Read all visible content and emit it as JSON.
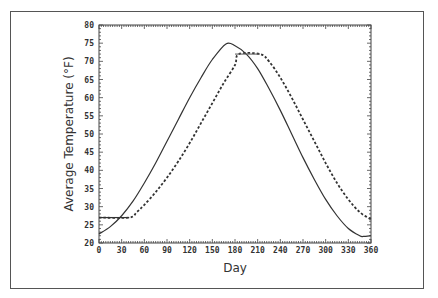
{
  "chart_data": {
    "type": "line",
    "title": "",
    "xlabel": "Day",
    "ylabel": "Average Temperature (°F)",
    "xlim": [
      0,
      360
    ],
    "ylim": [
      20,
      80
    ],
    "xticks": [
      0,
      30,
      60,
      90,
      120,
      150,
      180,
      210,
      240,
      270,
      300,
      330,
      360
    ],
    "yticks": [
      20,
      25,
      30,
      35,
      40,
      45,
      50,
      55,
      60,
      65,
      70,
      75,
      80
    ],
    "grid": false,
    "legend": null,
    "series": [
      {
        "name": "air temperature (solid)",
        "style": "solid",
        "x": [
          0,
          15,
          30,
          45,
          60,
          75,
          90,
          105,
          120,
          135,
          150,
          168,
          180,
          195,
          210,
          225,
          240,
          255,
          270,
          285,
          300,
          315,
          330,
          345,
          350,
          360
        ],
        "y": [
          22.5,
          24.5,
          27.5,
          31.5,
          36.5,
          42,
          48,
          54,
          60,
          65.5,
          70.5,
          74.8,
          74.3,
          72,
          68,
          62.5,
          56.5,
          50,
          43.5,
          37.5,
          32,
          27.5,
          24,
          22,
          21.8,
          22
        ]
      },
      {
        "name": "lagged temperature (dashed)",
        "style": "dashed",
        "x": [
          0,
          40,
          50,
          60,
          75,
          90,
          105,
          120,
          135,
          150,
          165,
          180,
          185,
          213,
          225,
          240,
          255,
          270,
          285,
          300,
          315,
          330,
          345,
          360
        ],
        "y": [
          27,
          27,
          28.5,
          30.5,
          34,
          38,
          42.5,
          47.5,
          53,
          58.5,
          64,
          69,
          72,
          72,
          70,
          65.5,
          60,
          54,
          48,
          42,
          36.5,
          32,
          28.5,
          26.5
        ]
      }
    ]
  }
}
